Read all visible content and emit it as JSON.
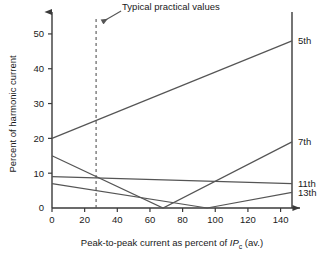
{
  "chart_data": {
    "type": "line",
    "title": "",
    "xlabel": "Peak-to-peak current as percent of IPc (av.)",
    "xlabel_parts": {
      "lead": "Peak-to-peak current as percent of ",
      "italic": "IP",
      "sub": "c",
      "tail": " (av.)"
    },
    "ylabel": "Percent of harmonic current",
    "xlim": [
      0,
      147
    ],
    "ylim": [
      0,
      54
    ],
    "xticks": [
      0,
      20,
      40,
      60,
      80,
      100,
      120,
      140
    ],
    "xtick_labels": [
      "0",
      "20",
      "40",
      "60",
      "80",
      "100",
      "120",
      "140"
    ],
    "yticks": [
      0,
      10,
      20,
      30,
      40,
      50
    ],
    "ytick_labels": [
      "0",
      "10",
      "20",
      "30",
      "40",
      "50"
    ],
    "grid": false,
    "legend_position": "right-edge-labels",
    "series": [
      {
        "name": "5th",
        "label": "5th",
        "points": [
          [
            0,
            20
          ],
          [
            147,
            48
          ]
        ]
      },
      {
        "name": "7th",
        "label": "7th",
        "points": [
          [
            0,
            15
          ],
          [
            68,
            0
          ],
          [
            147,
            19
          ]
        ]
      },
      {
        "name": "11th",
        "label": "11th",
        "points": [
          [
            0,
            9
          ],
          [
            147,
            7
          ]
        ]
      },
      {
        "name": "13th",
        "label": "13th",
        "points": [
          [
            0,
            7
          ],
          [
            95,
            0
          ],
          [
            147,
            4.5
          ]
        ]
      }
    ],
    "annotations": [
      {
        "name": "typical-practical-values",
        "text": "Typical practical values",
        "x": 27,
        "line_style": "dashed",
        "arrow": true
      }
    ]
  },
  "colors": {
    "axis": "#3a3a3a",
    "series": "#555555",
    "annotation": "#555555",
    "text": "#1a1a1a",
    "background": "#ffffff"
  }
}
